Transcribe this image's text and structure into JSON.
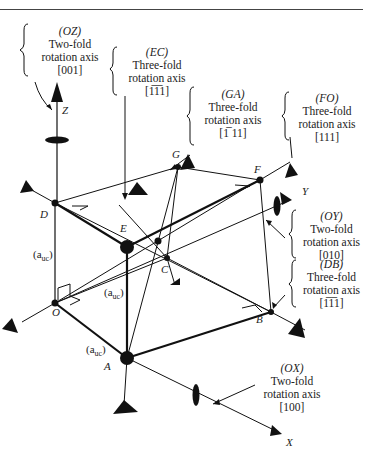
{
  "axes": {
    "z_label": "Z",
    "y_label": "Y",
    "x_label": "X"
  },
  "vertices": {
    "O": "O",
    "A": "A",
    "B": "B",
    "C": "C",
    "D": "D",
    "E": "E",
    "F": "F",
    "G": "G"
  },
  "edge_labels": {
    "vertical": "(a",
    "depth": "(a",
    "front": "(a",
    "subscript": "uc",
    "close": ")"
  },
  "annotations": [
    {
      "id": "OZ",
      "code": "(OZ)",
      "type": "Two-fold",
      "desc": "rotation axis",
      "direction": "[001]"
    },
    {
      "id": "EC",
      "code": "(EC)",
      "type": "Three-fold",
      "desc": "rotation axis",
      "direction": "[1̅1̅1]"
    },
    {
      "id": "GA",
      "code": "(GA)",
      "type": "Three-fold",
      "desc": "rotation axis",
      "direction": "[1̅ 11]"
    },
    {
      "id": "FO",
      "code": "(FO)",
      "type": "Three-fold",
      "desc": "rotation axis",
      "direction": "[111]"
    },
    {
      "id": "OY",
      "code": "(OY)",
      "type": "Two-fold",
      "desc": "rotation axis",
      "direction": "[010]"
    },
    {
      "id": "DB",
      "code": "(DB)",
      "type": "Three-fold",
      "desc": "rotation axis",
      "direction": "[1̅1̅1]"
    },
    {
      "id": "OX",
      "code": "(OX)",
      "type": "Two-fold",
      "desc": "rotation axis",
      "direction": "[100]"
    }
  ]
}
